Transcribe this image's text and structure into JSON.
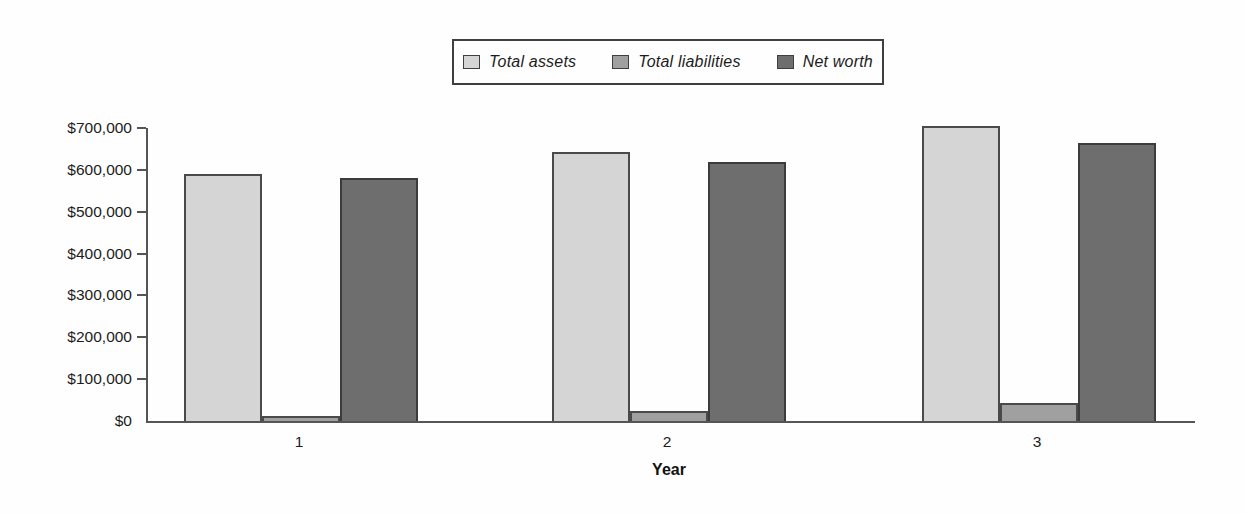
{
  "chart_data": {
    "type": "bar",
    "title": "",
    "xlabel": "Year",
    "ylabel": "",
    "categories": [
      "1",
      "2",
      "3"
    ],
    "series": [
      {
        "name": "Total assets",
        "fill": "#d5d5d5",
        "border": "#4a4a4a",
        "values": [
          590000,
          643000,
          705000
        ]
      },
      {
        "name": "Total liabilities",
        "fill": "#a0a0a0",
        "border": "#4a4a4a",
        "values": [
          12000,
          25000,
          42000
        ]
      },
      {
        "name": "Net worth",
        "fill": "#6e6e6e",
        "border": "#3c3c3c",
        "values": [
          580000,
          618000,
          663000
        ]
      }
    ],
    "ylim": [
      0,
      700000
    ],
    "ytick_step": 100000,
    "y_tick_labels": [
      "$0",
      "$100,000",
      "$200,000",
      "$300,000",
      "$400,000",
      "$500,000",
      "$600,000",
      "$700,000"
    ],
    "legend_position": "top-center",
    "grid": false,
    "axis_color": "#555555",
    "background_color": "#fefefe"
  }
}
